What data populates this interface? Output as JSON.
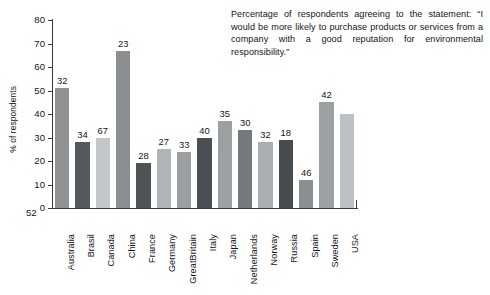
{
  "caption": {
    "text": "Percentage of respondents agreeing to the statement: “I would be more likely to purchase products or services from a company with a good reputation for environmental responsibility.”"
  },
  "page_number": "52",
  "chart_data": {
    "type": "bar",
    "title": "",
    "xlabel": "",
    "ylabel": "% of respondents",
    "ylim": [
      0,
      80
    ],
    "yticks": [
      0,
      10,
      20,
      30,
      40,
      50,
      60,
      70,
      80
    ],
    "ytick_labels": [
      "0",
      "10",
      "20",
      "30",
      "40",
      "50",
      "60",
      "70",
      "80"
    ],
    "grid": false,
    "legend": "none",
    "categories": [
      "Australia",
      "Brasil",
      "Canada",
      "China",
      "France",
      "Germany",
      "GreatBritain",
      "Italy",
      "Japan",
      "Netherlands",
      "Norway",
      "Russia",
      "Spain",
      "Sweden",
      "USA"
    ],
    "values": [
      51,
      28,
      30,
      67,
      19,
      25,
      24,
      30,
      37,
      33,
      28,
      29,
      12,
      45,
      40
    ],
    "point_labels": [
      "32",
      "34",
      "67",
      "23",
      "28",
      "27",
      "33",
      "40",
      "35",
      "30",
      "32",
      "18",
      "46",
      "42",
      ""
    ],
    "bar_colors": [
      "#8e9295",
      "#55595c",
      "#c3c7c9",
      "#8b8f92",
      "#4e5356",
      "#b0b5b8",
      "#9a9ea1",
      "#4a4f52",
      "#9ba0a3",
      "#74797c",
      "#a9aeb1",
      "#464b4e",
      "#8a8f92",
      "#9ca1a4",
      "#bcc1c4"
    ],
    "axis_color": "#3a3a3a"
  }
}
